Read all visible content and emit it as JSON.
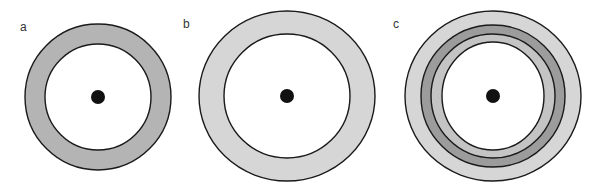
{
  "figure": {
    "background": "#ffffff",
    "stroke_color": "#1a1a1a",
    "panels": [
      {
        "label": "a",
        "label_pos": [
          20,
          31
        ],
        "center": [
          98,
          97
        ],
        "rings": [
          {
            "rx": 73,
            "ry": 73,
            "fill": "#b4b4b4"
          },
          {
            "rx": 53,
            "ry": 53,
            "fill": "#ffffff"
          }
        ],
        "dot": {
          "r": 7,
          "fill": "#111111"
        }
      },
      {
        "label": "b",
        "label_pos": [
          183,
          28
        ],
        "center": [
          287,
          96
        ],
        "rings": [
          {
            "rx": 88,
            "ry": 85,
            "fill": "#d6d6d6"
          },
          {
            "rx": 63,
            "ry": 62,
            "fill": "#ffffff"
          }
        ],
        "dot": {
          "r": 7,
          "fill": "#111111"
        }
      },
      {
        "label": "c",
        "label_pos": [
          393,
          28
        ],
        "center": [
          493,
          96
        ],
        "rings": [
          {
            "rx": 88,
            "ry": 85,
            "fill": "#d6d6d6"
          },
          {
            "rx": 72,
            "ry": 71,
            "fill": "#9c9c9c"
          },
          {
            "rx": 62,
            "ry": 62,
            "fill": "#c4c4c4"
          },
          {
            "rx": 51,
            "ry": 54,
            "fill": "#ffffff"
          }
        ],
        "dot": {
          "r": 7,
          "fill": "#111111"
        }
      }
    ]
  }
}
